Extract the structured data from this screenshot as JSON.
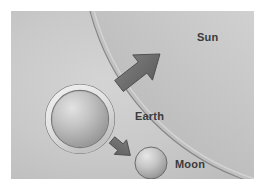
{
  "figure": {
    "frame": {
      "background_color": "#ffffff",
      "scene_background_color": "#c9c9c9",
      "margin_px": 11,
      "width_px": 265,
      "height_px": 190
    }
  },
  "labels": {
    "sun": "Sun",
    "earth": "Earth",
    "moon": "Moon",
    "text_color": "#3b3b3b"
  },
  "bodies": [
    {
      "name": "sun",
      "label": "Sun",
      "shape": "circle-arc",
      "role": "partial disc occupying upper-right corner",
      "center_x": 316,
      "center_y": -62,
      "radius": 245,
      "fill_light": "#e4e4e4",
      "fill_dark": "#bdbdbd",
      "edge_color": "#7d7d7d"
    },
    {
      "name": "earth",
      "label": "Earth",
      "shape": "circle-with-ring",
      "center_x": 69,
      "center_y": 108,
      "radius": 28,
      "ring_outer_radius": 34,
      "ring_color": "#e8e8e8",
      "ring_edge_color": "#6e6e6e",
      "fill_light": "#dcdcdc",
      "fill_dark": "#969696"
    },
    {
      "name": "moon",
      "label": "Moon",
      "shape": "circle",
      "center_x": 140,
      "center_y": 152,
      "radius": 16,
      "fill_light": "#e0e0e0",
      "fill_dark": "#909090",
      "edge_color": "#6b6b6b"
    }
  ],
  "arrows": [
    {
      "name": "earth-to-sun-arrow",
      "label": "",
      "from": "earth",
      "to": "sun",
      "direction_deg": 38,
      "size": "large",
      "fill": "#6f6f6f",
      "edge_color": "#4a4a4a"
    },
    {
      "name": "earth-to-moon-arrow",
      "label": "",
      "from": "earth",
      "to": "moon",
      "direction_deg": -40,
      "size": "small",
      "fill": "#6f6f6f",
      "edge_color": "#4a4a4a"
    }
  ]
}
